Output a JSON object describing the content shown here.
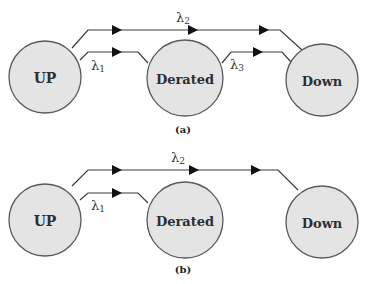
{
  "colors": {
    "background": "#ffffff",
    "state_fill": "#e4e4e4",
    "state_stroke": "#5a5a5a",
    "edge": "#3a3a3a",
    "arrowhead": "#111111",
    "text": "#2e2e2e"
  },
  "panels": [
    {
      "caption": "(a)",
      "states": [
        {
          "id": "up",
          "label": "UP"
        },
        {
          "id": "derated",
          "label": "Derated"
        },
        {
          "id": "down",
          "label": "Down"
        }
      ],
      "transitions": [
        {
          "from": "UP",
          "to": "Down",
          "rate_symbol": "λ",
          "rate_index": "2"
        },
        {
          "from": "UP",
          "to": "Derated",
          "rate_symbol": "λ",
          "rate_index": "1"
        },
        {
          "from": "Derated",
          "to": "Down",
          "rate_symbol": "λ",
          "rate_index": "3"
        }
      ]
    },
    {
      "caption": "(b)",
      "states": [
        {
          "id": "up",
          "label": "UP"
        },
        {
          "id": "derated",
          "label": "Derated"
        },
        {
          "id": "down",
          "label": "Down"
        }
      ],
      "transitions": [
        {
          "from": "UP",
          "to": "Down",
          "rate_symbol": "λ",
          "rate_index": "2"
        },
        {
          "from": "UP",
          "to": "Derated",
          "rate_symbol": "λ",
          "rate_index": "1"
        }
      ]
    }
  ]
}
